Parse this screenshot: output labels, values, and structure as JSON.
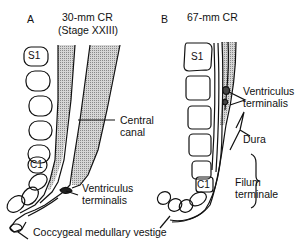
{
  "panels": [
    {
      "letter": "A",
      "title_line1": "30-mm CR",
      "title_line2": "(Stage XXIII)",
      "vertebra_labels": [
        "S1",
        "C1"
      ],
      "labels": {
        "central_canal_1": "Central",
        "central_canal_2": "canal",
        "ventriculus_1": "Ventriculus",
        "ventriculus_2": "terminalis",
        "vestige": "Coccygeal medullary vestige"
      }
    },
    {
      "letter": "B",
      "title_line1": "67-mm CR",
      "vertebra_labels": [
        "S1",
        "C1"
      ],
      "labels": {
        "ventriculus_1": "Ventriculus",
        "ventriculus_2": "terminalis",
        "dura": "Dura",
        "filum_1": "Filum",
        "filum_2": "terminale"
      }
    }
  ],
  "colors": {
    "line": "#111111",
    "stipple": "#b8b8b8",
    "background": "#ffffff"
  }
}
